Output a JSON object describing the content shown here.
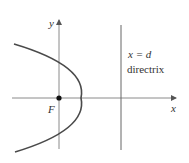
{
  "diagram": {
    "type": "parabola-focus-directrix",
    "colors": {
      "axis": "#8a8a8a",
      "curve": "#4a4a4a",
      "directrix": "#666666",
      "focus": "#111111",
      "text": "#333333"
    },
    "labels": {
      "y_axis": "y",
      "x_axis": "x",
      "focus": "F",
      "directrix_equation": "x = d",
      "directrix_name": "directrix"
    },
    "geometry": {
      "origin_px": [
        59,
        98
      ],
      "focus_px": [
        59,
        98
      ],
      "vertex_px": [
        81,
        98
      ],
      "directrix_x_px": 121,
      "parabola_opens": "left"
    }
  }
}
